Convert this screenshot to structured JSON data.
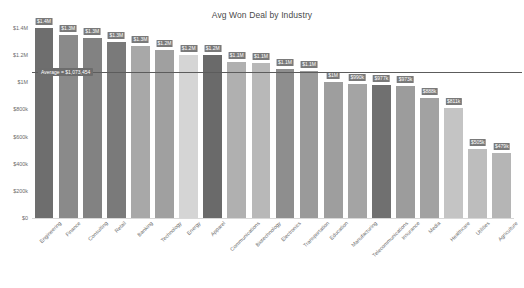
{
  "chart_data": {
    "type": "bar",
    "title": "Avg Won Deal by Industry",
    "xlabel": "",
    "ylabel": "",
    "ylim": [
      0,
      1400000
    ],
    "grid": false,
    "legend": null,
    "ytick_labels": [
      "$1.4M",
      "$1.2M",
      "$1M",
      "$800k",
      "$600k",
      "$400k",
      "$200k",
      "$0"
    ],
    "ytick_values": [
      1400000,
      1200000,
      1000000,
      800000,
      600000,
      400000,
      200000,
      0
    ],
    "annotations": [
      {
        "name": "average-line",
        "label": "Average = $1,073,454",
        "value": 1073454
      }
    ],
    "categories": [
      "Engineering",
      "Finance",
      "Consulting",
      "Retail",
      "Banking",
      "Technology",
      "Energy",
      "Apparel",
      "Communications",
      "Biotechnology",
      "Electronics",
      "Transportation",
      "Education",
      "Manufacturing",
      "Telecommunications",
      "Insurance",
      "Media",
      "Healthcare",
      "Utilities",
      "Agriculture"
    ],
    "values": [
      1400000,
      1350000,
      1330000,
      1300000,
      1270000,
      1240000,
      1200000,
      1200000,
      1150000,
      1140000,
      1100000,
      1080000,
      1000000,
      990000,
      977000,
      973000,
      888000,
      811000,
      505000,
      479000
    ],
    "value_labels": [
      "$1.4M",
      "$1.3M",
      "$1.3M",
      "$1.3M",
      "$1.3M",
      "$1.2M",
      "$1.2M",
      "$1.2M",
      "$1.1M",
      "$1.1M",
      "$1.1M",
      "$1.1M",
      "$1M",
      "$990k",
      "$977k",
      "$973k",
      "$888k",
      "$811k",
      "$505k",
      "$479k"
    ],
    "bar_colors": [
      "#6e6e6e",
      "#8a8a8a",
      "#828282",
      "#7a7a7a",
      "#a8a8a8",
      "#a0a0a0",
      "#d5d5d5",
      "#6a6a6a",
      "#b0b0b0",
      "#b8b8b8",
      "#8e8e8e",
      "#9a9a9a",
      "#9e9e9e",
      "#a4a4a4",
      "#707070",
      "#9c9c9c",
      "#a2a2a2",
      "#c4c4c4",
      "#bdbdbd",
      "#b5b5b5"
    ]
  }
}
